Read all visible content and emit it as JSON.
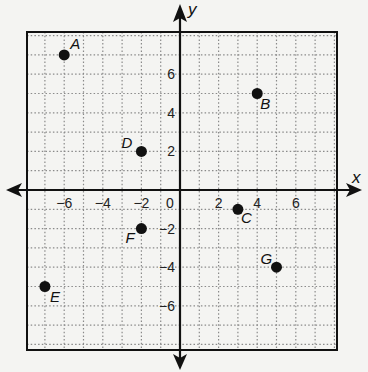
{
  "chart_data": {
    "type": "scatter",
    "title": "",
    "xlabel": "x",
    "ylabel": "y",
    "xlim": [
      -8,
      8
    ],
    "ylim": [
      -8,
      8
    ],
    "grid": true,
    "grid_style": "dotted",
    "x_ticks": [
      -6,
      -4,
      -2,
      0,
      2,
      4,
      6
    ],
    "y_ticks": [
      6,
      4,
      2,
      -2,
      -4,
      -6
    ],
    "x_tick_labels": [
      "-6",
      "-4",
      "-2",
      "0",
      "2",
      "4",
      "6"
    ],
    "y_tick_labels": [
      "6",
      "4",
      "2",
      "-2",
      "-4",
      "-6"
    ],
    "points": [
      {
        "label": "A",
        "x": -6,
        "y": 7
      },
      {
        "label": "B",
        "x": 4,
        "y": 5
      },
      {
        "label": "C",
        "x": 3,
        "y": -1
      },
      {
        "label": "D",
        "x": -2,
        "y": 2
      },
      {
        "label": "E",
        "x": -7,
        "y": -5
      },
      {
        "label": "F",
        "x": -2,
        "y": -2
      },
      {
        "label": "G",
        "x": 5,
        "y": -4
      }
    ],
    "legend": null
  },
  "colors": {
    "background": "#f4f4f2",
    "ink": "#111111",
    "grid": "#8a8a8a"
  }
}
